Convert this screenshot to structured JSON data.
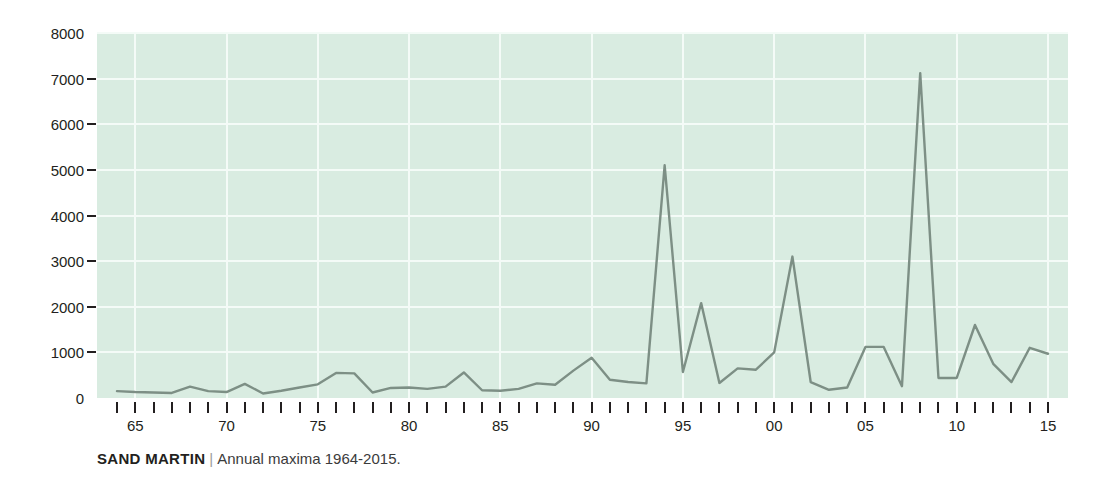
{
  "caption": {
    "species": "SAND MARTIN",
    "separator": "|",
    "description": "Annual maxima 1964-2015."
  },
  "colors": {
    "plot_background": "#d9ece1",
    "gridline": "#f4fbf7",
    "line": "#7d8f85",
    "text": "#231f20",
    "caption_muted": "#9b9b9b"
  },
  "chart_data": {
    "type": "line",
    "title": "SAND MARTIN",
    "subtitle": "Annual maxima 1964-2015.",
    "xlabel": "",
    "ylabel": "",
    "xlim": [
      1964,
      2015
    ],
    "ylim": [
      0,
      8000
    ],
    "grid": true,
    "legend": null,
    "y_ticks": [
      0,
      1000,
      2000,
      3000,
      4000,
      5000,
      6000,
      7000,
      8000
    ],
    "y_tick_labels": [
      "0",
      "1000",
      "2000",
      "3000",
      "4000",
      "5000",
      "6000",
      "7000",
      "8000"
    ],
    "x_ticks": [
      1965,
      1970,
      1975,
      1980,
      1985,
      1990,
      1995,
      2000,
      2005,
      2010,
      2015
    ],
    "x_tick_labels": [
      "65",
      "70",
      "75",
      "80",
      "85",
      "90",
      "95",
      "00",
      "05",
      "10",
      "15"
    ],
    "x_minor_ticks": [
      1964,
      1965,
      1966,
      1967,
      1968,
      1969,
      1970,
      1971,
      1972,
      1973,
      1974,
      1975,
      1976,
      1977,
      1978,
      1979,
      1980,
      1981,
      1982,
      1983,
      1984,
      1985,
      1986,
      1987,
      1988,
      1989,
      1990,
      1991,
      1992,
      1993,
      1994,
      1995,
      1996,
      1997,
      1998,
      1999,
      2000,
      2001,
      2002,
      2003,
      2004,
      2005,
      2006,
      2007,
      2008,
      2009,
      2010,
      2011,
      2012,
      2013,
      2014,
      2015
    ],
    "x": [
      1964,
      1965,
      1966,
      1967,
      1968,
      1969,
      1970,
      1971,
      1972,
      1973,
      1974,
      1975,
      1976,
      1977,
      1978,
      1979,
      1980,
      1981,
      1982,
      1983,
      1984,
      1985,
      1986,
      1987,
      1988,
      1989,
      1990,
      1991,
      1992,
      1993,
      1994,
      1995,
      1996,
      1997,
      1998,
      1999,
      2000,
      2001,
      2002,
      2003,
      2004,
      2005,
      2006,
      2007,
      2008,
      2009,
      2010,
      2011,
      2012,
      2013,
      2014,
      2015
    ],
    "values": [
      150,
      130,
      120,
      110,
      250,
      150,
      130,
      310,
      100,
      160,
      230,
      300,
      550,
      540,
      120,
      220,
      230,
      200,
      250,
      560,
      170,
      160,
      200,
      320,
      290,
      600,
      880,
      400,
      350,
      320,
      5100,
      570,
      2080,
      330,
      650,
      620,
      1000,
      3100,
      350,
      180,
      230,
      1120,
      1120,
      260,
      7120,
      440,
      440,
      1600,
      750,
      350,
      1100,
      970
    ],
    "series": [
      {
        "name": "Annual maxima",
        "color": "#7d8f85",
        "values": [
          150,
          130,
          120,
          110,
          250,
          150,
          130,
          310,
          100,
          160,
          230,
          300,
          550,
          540,
          120,
          220,
          230,
          200,
          250,
          560,
          170,
          160,
          200,
          320,
          290,
          600,
          880,
          400,
          350,
          320,
          5100,
          570,
          2080,
          330,
          650,
          620,
          1000,
          3100,
          350,
          180,
          230,
          1120,
          1120,
          260,
          7120,
          440,
          440,
          1600,
          750,
          350,
          1100,
          970
        ]
      }
    ],
    "annotations": []
  }
}
